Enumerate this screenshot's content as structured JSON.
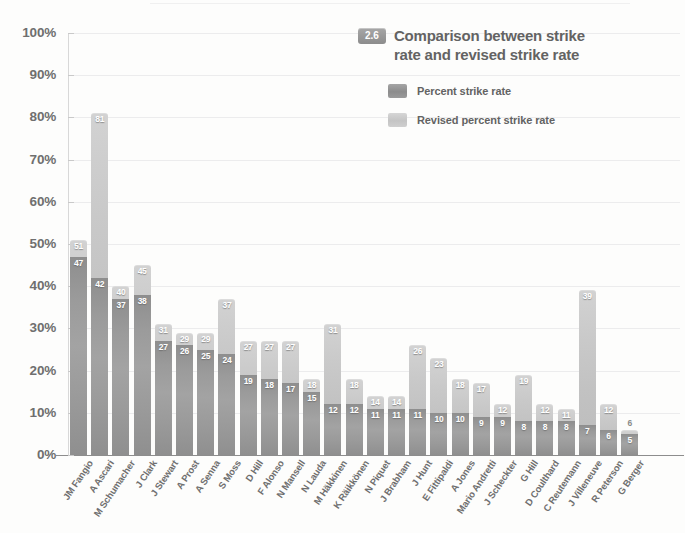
{
  "header": {
    "badge": "2.6",
    "title_line1": "Comparison between strike",
    "title_line2": "rate and revised strike rate"
  },
  "legend": {
    "position": "top-right",
    "items": [
      {
        "label": "Percent strike rate",
        "color": "#949494",
        "key": "percent"
      },
      {
        "label": "Revised percent strike rate",
        "color": "#c8c8c8",
        "key": "revised"
      }
    ]
  },
  "axis": {
    "y_ticks": [
      "0%",
      "10%",
      "20%",
      "30%",
      "40%",
      "50%",
      "60%",
      "70%",
      "80%",
      "90%",
      "100%"
    ],
    "y_min": 0,
    "y_max": 100
  },
  "chart_data": {
    "type": "bar",
    "title": "Comparison between strike rate and revised strike rate",
    "xlabel": "",
    "ylabel": "",
    "ylim": [
      0,
      100
    ],
    "grid": true,
    "stacked_overlay": true,
    "legend_position": "top-right",
    "categories": [
      "JM Fangio",
      "A Ascari",
      "M Schumacher",
      "J Clark",
      "J Stewart",
      "A Prost",
      "A Senna",
      "S Moss",
      "D Hill",
      "F Alonso",
      "N Mansell",
      "N Lauda",
      "M Häkkinen",
      "K Räikkönen",
      "N Piquet",
      "J Brabham",
      "J Hunt",
      "E Fittipaldi",
      "A Jones",
      "Mario Andretti",
      "J Scheckter",
      "G Hill",
      "D Coulthard",
      "C Reutemann",
      "J Villeneuve",
      "R Peterson",
      "G Berger"
    ],
    "series": [
      {
        "name": "Percent strike rate",
        "color": "#949494",
        "values": [
          47,
          42,
          37,
          38,
          27,
          26,
          25,
          24,
          19,
          18,
          17,
          15,
          12,
          12,
          11,
          11,
          11,
          10,
          10,
          9,
          9,
          8,
          8,
          8,
          7,
          6,
          5
        ]
      },
      {
        "name": "Revised percent strike rate",
        "color": "#c8c8c8",
        "values": [
          51,
          81,
          40,
          45,
          31,
          29,
          29,
          37,
          27,
          27,
          27,
          18,
          31,
          18,
          14,
          14,
          26,
          23,
          18,
          17,
          12,
          19,
          12,
          11,
          39,
          12,
          6
        ]
      }
    ],
    "label_outside_flags": [
      false,
      false,
      false,
      false,
      false,
      false,
      false,
      false,
      false,
      false,
      false,
      false,
      false,
      false,
      false,
      false,
      false,
      false,
      false,
      false,
      false,
      false,
      false,
      false,
      false,
      false,
      true
    ]
  }
}
